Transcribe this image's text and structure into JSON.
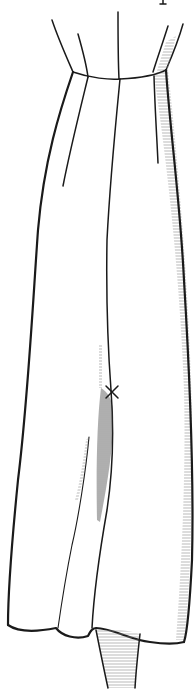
{
  "figure": {
    "ink_color": "#1a1a1a",
    "shading_color": "#555555",
    "background_color": "#ffffff",
    "marker": "×"
  }
}
